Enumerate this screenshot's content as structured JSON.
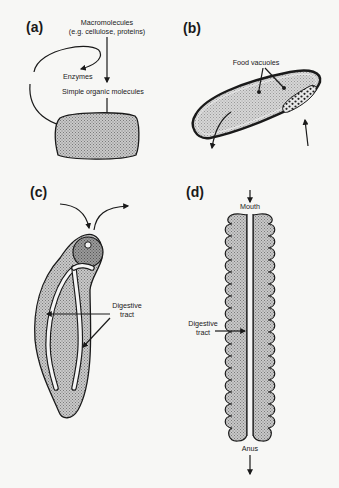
{
  "figure": {
    "panels": [
      {
        "id": "a",
        "label": "(a)",
        "texts": {
          "macromolecules": "Macromolecules",
          "macromolecules_examples": "(e.g. cellulose, proteins)",
          "enzymes": "Enzymes",
          "simple_molecules": "Simple organic molecules"
        }
      },
      {
        "id": "b",
        "label": "(b)",
        "texts": {
          "food_vacuoles": "Food vacuoles"
        }
      },
      {
        "id": "c",
        "label": "(c)",
        "texts": {
          "digestive_line1": "Digestive",
          "digestive_line2": "tract"
        }
      },
      {
        "id": "d",
        "label": "(d)",
        "texts": {
          "mouth": "Mouth",
          "digestive_line1": "Digestive",
          "digestive_line2": "tract",
          "anus": "Anus"
        }
      }
    ],
    "colors": {
      "background": "#f7f7f5",
      "ink": "#1a1a1a",
      "stipple_fill": "#b8b8b8",
      "dark_fill": "#8e8e8e"
    }
  }
}
